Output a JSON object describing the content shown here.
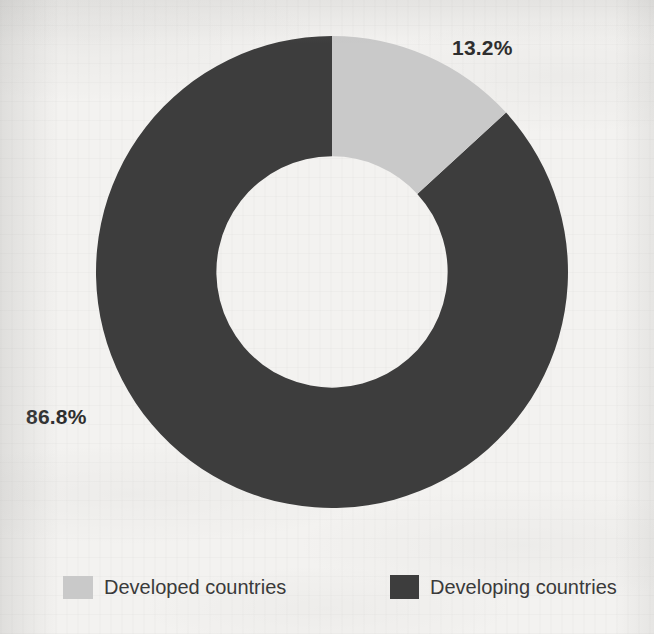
{
  "figure": {
    "background_color": "#f3f2f0",
    "media": "scanned-page"
  },
  "labels": {
    "developed_value": "13.2%",
    "developing_value": "86.8%"
  },
  "legend": {
    "items": [
      {
        "label": "Developed countries",
        "color": "#c9c9c9",
        "swatch_icon": "legend-swatch-icon"
      },
      {
        "label": "Developing countries",
        "color": "#3d3d3d",
        "swatch_icon": "legend-swatch-icon"
      }
    ]
  },
  "chart_data": {
    "type": "pie",
    "variant": "donut",
    "title": "",
    "subtitle": "",
    "xlabel": "",
    "ylabel": "",
    "grid": false,
    "legend_position": "bottom",
    "units": "percent",
    "total": 100,
    "start_angle_deg": 0,
    "direction": "clockwise",
    "inner_radius_ratio": 0.49,
    "categories": [
      "Developed countries",
      "Developing countries"
    ],
    "values": [
      13.2,
      86.8
    ],
    "colors": [
      "#c9c9c9",
      "#3d3d3d"
    ],
    "slices": [
      {
        "label": "Developed countries",
        "value": 13.2,
        "data_label": "13.2%",
        "color": "#c9c9c9",
        "start_angle_deg": 0,
        "end_angle_deg": 47.52
      },
      {
        "label": "Developing countries",
        "value": 86.8,
        "data_label": "86.8%",
        "color": "#3d3d3d",
        "start_angle_deg": 47.52,
        "end_angle_deg": 360
      }
    ],
    "annotations": [
      {
        "text": "13.2%",
        "target": "Developed countries",
        "placement": "outside-upper-right"
      },
      {
        "text": "86.8%",
        "target": "Developing countries",
        "placement": "outside-left"
      }
    ]
  }
}
